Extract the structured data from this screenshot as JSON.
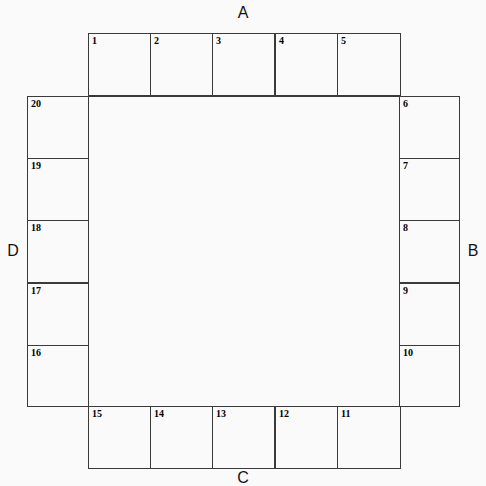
{
  "diagram": {
    "type": "rectangular-ring-seating-plan",
    "title": "",
    "side_labels": [
      {
        "id": "A",
        "text": "A",
        "position": "top"
      },
      {
        "id": "B",
        "text": "B",
        "position": "right"
      },
      {
        "id": "C",
        "text": "C",
        "position": "bottom"
      },
      {
        "id": "D",
        "text": "D",
        "position": "left"
      }
    ],
    "cell_count": 20,
    "numbering_direction": "clockwise-from-top-left",
    "sides": {
      "top": {
        "label": "A",
        "cells": [
          {
            "number": "1",
            "x": 88,
            "y": 33
          },
          {
            "number": "2",
            "x": 150,
            "y": 33
          },
          {
            "number": "3",
            "x": 212,
            "y": 33
          },
          {
            "number": "4",
            "x": 275,
            "y": 33
          },
          {
            "number": "5",
            "x": 337,
            "y": 33
          }
        ]
      },
      "right": {
        "label": "B",
        "cells": [
          {
            "number": "6",
            "x": 399,
            "y": 96
          },
          {
            "number": "7",
            "x": 399,
            "y": 158
          },
          {
            "number": "8",
            "x": 399,
            "y": 220
          },
          {
            "number": "9",
            "x": 399,
            "y": 283
          },
          {
            "number": "10",
            "x": 399,
            "y": 345
          }
        ]
      },
      "bottom": {
        "label": "C",
        "cells": [
          {
            "number": "11",
            "x": 337,
            "y": 406
          },
          {
            "number": "12",
            "x": 275,
            "y": 406
          },
          {
            "number": "13",
            "x": 212,
            "y": 406
          },
          {
            "number": "14",
            "x": 150,
            "y": 406
          },
          {
            "number": "15",
            "x": 88,
            "y": 406
          }
        ]
      },
      "left": {
        "label": "D",
        "cells": [
          {
            "number": "16",
            "x": 27,
            "y": 345
          },
          {
            "number": "17",
            "x": 27,
            "y": 283
          },
          {
            "number": "18",
            "x": 27,
            "y": 220
          },
          {
            "number": "19",
            "x": 27,
            "y": 158
          },
          {
            "number": "20",
            "x": 27,
            "y": 96
          }
        ]
      }
    },
    "colors": {
      "background": "#fafafa",
      "line": "#3a3a3a",
      "text": "#000000"
    }
  }
}
